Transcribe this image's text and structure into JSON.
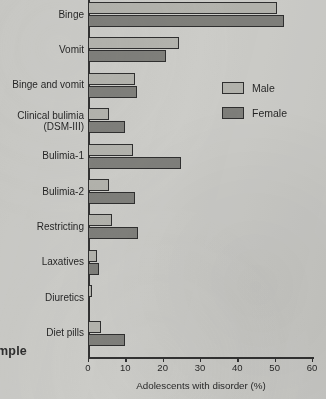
{
  "page": {
    "bleed_text": "mple",
    "background_color": "#cdcdc9"
  },
  "legend": {
    "position": "upper-right",
    "items": [
      {
        "label": "Male",
        "color": "#b3b3ad"
      },
      {
        "label": "Female",
        "color": "#7e7e79"
      }
    ]
  },
  "chart_data": {
    "type": "bar",
    "orientation": "horizontal",
    "title": "",
    "xlabel": "Adolescents with disorder (%)",
    "ylabel": "",
    "xlim": [
      0,
      60
    ],
    "xticks": [
      0,
      10,
      20,
      30,
      40,
      50,
      60
    ],
    "xtick_labels": [
      "0",
      "10",
      "20",
      "30",
      "40",
      "50",
      "60"
    ],
    "grid": false,
    "legend_position": "upper right",
    "categories": [
      "Binge",
      "Vomit",
      "Binge and vomit",
      "Clinical bulimia\n(DSM-III)",
      "Bulimia-1",
      "Bulimia-2",
      "Restricting",
      "Laxatives",
      "Diuretics",
      "Diet pills"
    ],
    "series": [
      {
        "name": "Male",
        "color": "#b3b3ad",
        "values": [
          50.5,
          24.5,
          12.5,
          5.5,
          12.0,
          5.5,
          6.5,
          2.5,
          1.0,
          3.5
        ]
      },
      {
        "name": "Female",
        "color": "#7e7e79",
        "values": [
          52.5,
          21.0,
          13.0,
          10.0,
          25.0,
          12.5,
          13.5,
          3.0,
          0.4,
          10.0
        ]
      }
    ]
  }
}
